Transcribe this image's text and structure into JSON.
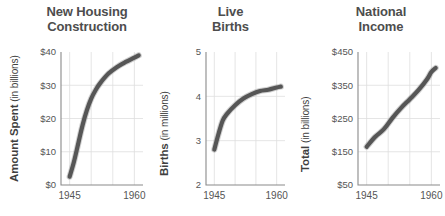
{
  "figure": {
    "background_color": "#ffffff",
    "line_color": "#565656",
    "grid_color": "#dedede",
    "axis_color": "#8a8a8a",
    "text_color": "#4a4a4a"
  },
  "chart_data": [
    {
      "type": "line",
      "title": "New Housing Construction",
      "title_lines": [
        "New Housing",
        "Construction"
      ],
      "ylabel_strong": "Amount Spent",
      "ylabel_light": "(in billions)",
      "xlabel": "",
      "grid": true,
      "legend": "none",
      "xlim": [
        1943,
        1962
      ],
      "ylim": [
        0,
        40
      ],
      "yticks": [
        0,
        10,
        20,
        30,
        40
      ],
      "ytick_labels": [
        "$0",
        "$10",
        "$20",
        "$30",
        "$40"
      ],
      "xticks": [
        1945,
        1960
      ],
      "xtick_labels": [
        "1945",
        "1960"
      ],
      "x": [
        1945,
        1946,
        1947,
        1948,
        1949,
        1950,
        1951,
        1952,
        1954,
        1956,
        1958,
        1960,
        1961
      ],
      "values": [
        2.5,
        7.0,
        12.5,
        18.0,
        22.5,
        26.0,
        28.5,
        30.5,
        33.5,
        35.5,
        37.0,
        38.3,
        39.0
      ]
    },
    {
      "type": "line",
      "title": "Live Births",
      "title_lines": [
        "Live",
        "Births"
      ],
      "ylabel_strong": "Births",
      "ylabel_light": "(in millions)",
      "xlabel": "",
      "grid": true,
      "legend": "none",
      "xlim": [
        1943,
        1962
      ],
      "ylim": [
        2,
        5
      ],
      "yticks": [
        2,
        3,
        4,
        5
      ],
      "ytick_labels": [
        "2",
        "3",
        "4",
        "5"
      ],
      "xticks": [
        1945,
        1960
      ],
      "xtick_labels": [
        "1945",
        "1960"
      ],
      "x": [
        1945,
        1946,
        1947,
        1948,
        1950,
        1952,
        1954,
        1956,
        1958,
        1960,
        1961
      ],
      "values": [
        2.8,
        3.15,
        3.45,
        3.6,
        3.8,
        3.95,
        4.05,
        4.12,
        4.15,
        4.2,
        4.22
      ]
    },
    {
      "type": "line",
      "title": "National Income",
      "title_lines": [
        "National",
        "Income"
      ],
      "ylabel_strong": "Total",
      "ylabel_light": "(in billions)",
      "xlabel": "",
      "grid": true,
      "legend": "none",
      "xlim": [
        1943,
        1962
      ],
      "ylim": [
        50,
        450
      ],
      "yticks": [
        50,
        150,
        250,
        350,
        450
      ],
      "ytick_labels": [
        "$50",
        "$150",
        "$250",
        "$350",
        "$450"
      ],
      "xticks": [
        1945,
        1960
      ],
      "xtick_labels": [
        "1945",
        "1960"
      ],
      "x": [
        1945,
        1947,
        1949,
        1951,
        1953,
        1955,
        1957,
        1959,
        1960,
        1961
      ],
      "values": [
        165,
        195,
        218,
        252,
        282,
        308,
        335,
        368,
        390,
        402
      ]
    }
  ]
}
